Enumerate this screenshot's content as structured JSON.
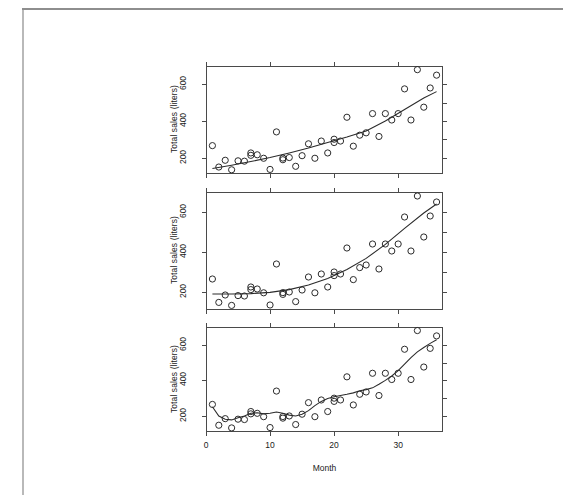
{
  "figure": {
    "axis_title_x": "Month",
    "axis_title_y": "Total sales (liters)",
    "x_tick_labels": [
      "0",
      "10",
      "20",
      "30"
    ],
    "x_tick_values": [
      0,
      10,
      20,
      30
    ],
    "y_tick_labels": [
      "200",
      "400",
      "600"
    ],
    "y_tick_values": [
      200,
      400,
      600
    ],
    "point_color": "#2b2b2b",
    "line_color": "#2b2b2b",
    "frame_color": "#4a4a4a",
    "page_border_color": "#b9b9b9"
  },
  "chart_data": [
    {
      "type": "scatter",
      "panel_index": 1,
      "title": "",
      "xlabel": "",
      "ylabel": "Total sales (liters)",
      "xlim": [
        0,
        37
      ],
      "ylim": [
        110,
        700
      ],
      "grid": false,
      "legend": "none",
      "x": [
        1,
        2,
        3,
        4,
        5,
        6,
        7,
        7,
        8,
        9,
        10,
        11,
        12,
        12,
        13,
        14,
        15,
        16,
        17,
        18,
        19,
        20,
        20,
        21,
        22,
        23,
        24,
        25,
        26,
        27,
        28,
        29,
        30,
        31,
        32,
        33,
        34,
        35,
        36
      ],
      "y": [
        265,
        148,
        185,
        133,
        182,
        180,
        225,
        212,
        215,
        196,
        135,
        340,
        197,
        188,
        200,
        152,
        210,
        275,
        196,
        290,
        225,
        300,
        282,
        290,
        420,
        262,
        322,
        335,
        440,
        315,
        440,
        405,
        440,
        575,
        405,
        680,
        475,
        580,
        650
      ],
      "annotations": [
        "fitted smooth trend line (near-linear increasing)"
      ],
      "series": [
        {
          "name": "observed total sales",
          "type": "scatter"
        },
        {
          "name": "fitted trend",
          "type": "line",
          "x": [
            1,
            4,
            7,
            10,
            13,
            16,
            19,
            22,
            25,
            28,
            31,
            34,
            36
          ],
          "y": [
            140,
            158,
            178,
            200,
            225,
            252,
            282,
            312,
            345,
            400,
            462,
            525,
            560
          ]
        }
      ]
    },
    {
      "type": "scatter",
      "panel_index": 2,
      "title": "",
      "xlabel": "",
      "ylabel": "Total sales (liters)",
      "xlim": [
        0,
        37
      ],
      "ylim": [
        110,
        700
      ],
      "grid": false,
      "legend": "none",
      "x": [
        1,
        2,
        3,
        4,
        5,
        6,
        7,
        7,
        8,
        9,
        10,
        11,
        12,
        12,
        13,
        14,
        15,
        16,
        17,
        18,
        19,
        20,
        20,
        21,
        22,
        23,
        24,
        25,
        26,
        27,
        28,
        29,
        30,
        31,
        32,
        33,
        34,
        35,
        36
      ],
      "y": [
        265,
        148,
        185,
        133,
        182,
        180,
        225,
        212,
        215,
        196,
        135,
        340,
        197,
        188,
        200,
        152,
        210,
        275,
        196,
        290,
        225,
        300,
        282,
        290,
        420,
        262,
        322,
        335,
        440,
        315,
        440,
        405,
        440,
        575,
        405,
        680,
        475,
        580,
        650
      ],
      "annotations": [
        "fitted smooth trend line (flat then accelerating, quadratic)"
      ],
      "series": [
        {
          "name": "observed total sales",
          "type": "scatter"
        },
        {
          "name": "fitted trend",
          "type": "line",
          "x": [
            1,
            4,
            7,
            10,
            13,
            16,
            19,
            22,
            25,
            28,
            31,
            34,
            36
          ],
          "y": [
            190,
            190,
            192,
            198,
            212,
            235,
            268,
            312,
            368,
            438,
            518,
            595,
            640
          ]
        }
      ]
    },
    {
      "type": "scatter",
      "panel_index": 3,
      "title": "",
      "xlabel": "Month",
      "ylabel": "Total sales (liters)",
      "xlim": [
        0,
        37
      ],
      "ylim": [
        110,
        700
      ],
      "grid": false,
      "legend": "none",
      "x": [
        1,
        2,
        3,
        4,
        5,
        6,
        7,
        7,
        8,
        9,
        10,
        11,
        12,
        12,
        13,
        14,
        15,
        16,
        17,
        18,
        19,
        20,
        20,
        21,
        22,
        23,
        24,
        25,
        26,
        27,
        28,
        29,
        30,
        31,
        32,
        33,
        34,
        35,
        36
      ],
      "y": [
        265,
        148,
        185,
        133,
        182,
        180,
        225,
        212,
        215,
        196,
        135,
        340,
        197,
        188,
        200,
        152,
        210,
        275,
        196,
        290,
        225,
        300,
        282,
        290,
        420,
        262,
        322,
        335,
        440,
        315,
        440,
        405,
        440,
        575,
        405,
        680,
        475,
        580,
        650
      ],
      "annotations": [
        "fitted loess smoother (wiggly, follows local means)"
      ],
      "series": [
        {
          "name": "observed total sales",
          "type": "scatter"
        },
        {
          "name": "fitted trend",
          "type": "line",
          "x": [
            1,
            2,
            3,
            4,
            5,
            6,
            7,
            8,
            9,
            10,
            11,
            12,
            13,
            14,
            15,
            16,
            17,
            18,
            19,
            20,
            21,
            22,
            23,
            24,
            25,
            26,
            27,
            28,
            29,
            30,
            31,
            32,
            33,
            34,
            35,
            36
          ],
          "y": [
            252,
            200,
            182,
            178,
            190,
            200,
            215,
            218,
            212,
            215,
            222,
            215,
            205,
            200,
            210,
            230,
            258,
            282,
            298,
            308,
            315,
            322,
            330,
            342,
            348,
            358,
            378,
            400,
            425,
            455,
            492,
            528,
            560,
            585,
            608,
            628
          ]
        }
      ]
    }
  ]
}
